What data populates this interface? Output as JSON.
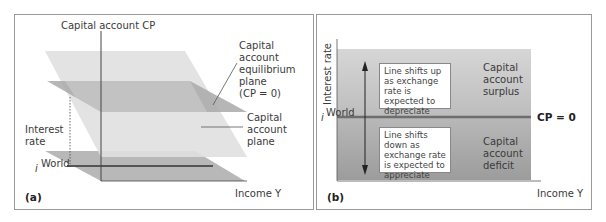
{
  "panel_a": {
    "label": "(a)",
    "vertical_axis": "Capital account CP",
    "interest_axis": [
      "Interest",
      "rate"
    ],
    "income_axis": "Income Y",
    "i_world": "i",
    "i_world_sup": "World",
    "equilibrium_label": [
      "Capital",
      "account",
      "equilibrium",
      "plane",
      "(CP = 0)"
    ],
    "plane_label": [
      "Capital",
      "account",
      "plane"
    ]
  },
  "panel_b": {
    "label": "(b)",
    "y_axis": "Interest rate",
    "x_axis": "Income Y",
    "i_world": "i",
    "i_world_sup": "World",
    "cp_zero": "CP = 0",
    "surplus_label": [
      "Capital",
      "account",
      "surplus"
    ],
    "deficit_label": [
      "Capital",
      "account",
      "deficit"
    ],
    "box_up": "Line shifts up as exchange rate is expected to depreciate",
    "box_down": "Line shifts down as exchange rate is expected to appreciate"
  },
  "colors": {
    "plane_light": "#dcdcdc",
    "plane_dark": "#a8a8a8",
    "floor": "#b4b4b4",
    "line": "#6a6a6a",
    "surplus_top": "#d2d2d2",
    "deficit_bottom": "#a0a0a0"
  }
}
